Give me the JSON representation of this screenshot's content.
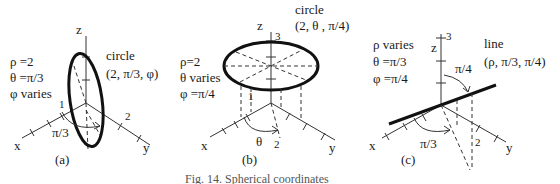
{
  "panels": [
    {
      "id": "a",
      "label": "(a)",
      "params": [
        "ρ =2",
        "θ =π/3",
        "φ varies"
      ],
      "curve_title": "circle",
      "curve_coords": "(2, π/3, φ)",
      "axes": {
        "x": "x",
        "y": "y",
        "z": "z"
      },
      "ticks": {
        "one": "1",
        "two": "2"
      },
      "angle_label": "π/3"
    },
    {
      "id": "b",
      "label": "(b)",
      "params": [
        "ρ=2",
        "θ varies",
        "φ =π/4"
      ],
      "curve_title": "circle",
      "curve_coords": "(2, θ , π/4)",
      "axes": {
        "x": "x",
        "y": "y",
        "z": "z"
      },
      "ticks": {
        "one": "1",
        "two": "2",
        "three": "3"
      },
      "angle_label": "θ"
    },
    {
      "id": "c",
      "label": "(c)",
      "params": [
        "ρ varies",
        "θ =π/3",
        "φ =π/4"
      ],
      "curve_title": "line",
      "curve_coords": "(ρ, π/3, π/4)",
      "axes": {
        "x": "x",
        "y": "y",
        "z": "z"
      },
      "ticks": {
        "two": "2",
        "three": "3"
      },
      "angle_label": "π/3",
      "angle_label_2": "π/4"
    }
  ],
  "caption": "Fig. 14.  Spherical coordinates"
}
